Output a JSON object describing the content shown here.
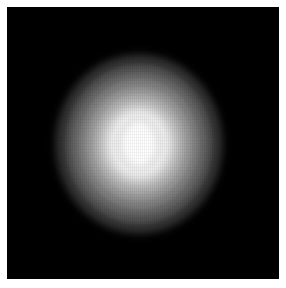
{
  "figure": {
    "kind": "grayscale-intensity-image",
    "alt_label": "Grayscale intensity map of a compact extended source",
    "canvas": {
      "background_color": "#000000",
      "page_background_color": "#ffffff",
      "left": 7,
      "top": 7,
      "width": 272,
      "height": 272
    },
    "colormap": "grayscale",
    "colormap_min_color": "#000000",
    "colormap_max_color": "#ffffff"
  },
  "chart_data": {
    "type": "heatmap",
    "title": "",
    "subtitle": "",
    "xlabel": "",
    "ylabel": "",
    "grid": false,
    "legend": "none",
    "axis_ticks_visible": false,
    "colorbar_visible": false,
    "xlim": [
      0,
      272
    ],
    "ylim": [
      0,
      272
    ],
    "source_center": {
      "x": 139,
      "y": 144
    },
    "source_extent": {
      "x_min": 62,
      "x_max": 222,
      "y_min": 58,
      "y_max": 232
    },
    "contour_levels": [
      {
        "name": "background",
        "gray": 0,
        "hex": "#000000",
        "radius_x": 0,
        "radius_y": 0
      },
      {
        "name": "halo-8",
        "gray": 38,
        "hex": "#262626",
        "radius_x": 84,
        "radius_y": 90
      },
      {
        "name": "halo-7",
        "gray": 58,
        "hex": "#3a3a3a",
        "radius_x": 79,
        "radius_y": 85
      },
      {
        "name": "halo-6",
        "gray": 82,
        "hex": "#525252",
        "radius_x": 73,
        "radius_y": 79
      },
      {
        "name": "halo-5",
        "gray": 104,
        "hex": "#686868",
        "radius_x": 67,
        "radius_y": 72
      },
      {
        "name": "halo-4",
        "gray": 128,
        "hex": "#808080",
        "radius_x": 60,
        "radius_y": 65
      },
      {
        "name": "halo-3",
        "gray": 152,
        "hex": "#989898",
        "radius_x": 53,
        "radius_y": 57
      },
      {
        "name": "halo-2",
        "gray": 176,
        "hex": "#b0b0b0",
        "radius_x": 46,
        "radius_y": 50
      },
      {
        "name": "halo-1",
        "gray": 200,
        "hex": "#c8c8c8",
        "radius_x": 40,
        "radius_y": 43
      },
      {
        "name": "inner-bright",
        "gray": 226,
        "hex": "#e2e2e2",
        "radius_x": 34,
        "radius_y": 37
      },
      {
        "name": "near-saturated",
        "gray": 243,
        "hex": "#f3f3f3",
        "radius_x": 28,
        "radius_y": 31
      },
      {
        "name": "core-saturated",
        "gray": 255,
        "hex": "#ffffff",
        "radius_x": 16,
        "radius_y": 21
      }
    ],
    "core_annulus": {
      "name": "core-annulus",
      "gray": 237,
      "hex": "#ededed",
      "outer_radius_x": 26,
      "outer_radius_y": 30,
      "inner_radius_x": 16,
      "inner_radius_y": 21
    },
    "peak_value_gray": 255,
    "background_value_gray": 0
  }
}
